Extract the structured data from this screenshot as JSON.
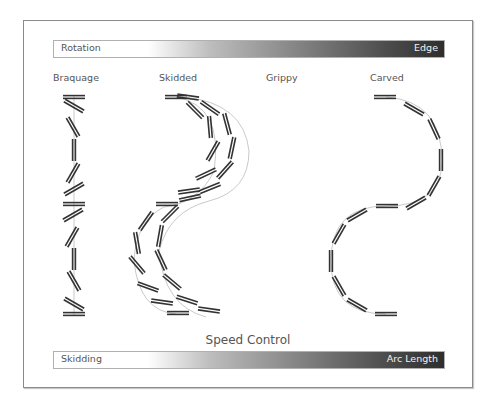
{
  "top_bar": {
    "left_label": "Rotation",
    "right_label": "Edge"
  },
  "bottom_bar": {
    "left_label": "Skidding",
    "right_label": "Arc Length"
  },
  "axis_title": "Speed Control",
  "columns": [
    {
      "title": "Braquage"
    },
    {
      "title": "Skidded"
    },
    {
      "title": "Grippy"
    },
    {
      "title": "Carved"
    }
  ],
  "colors": {
    "frame": "#8a8a8a",
    "ski": "#333333",
    "path": "#bbbbbb",
    "text": "#555555"
  }
}
